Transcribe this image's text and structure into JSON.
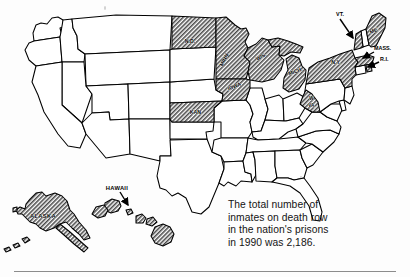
{
  "figure": {
    "caption": {
      "lines": [
        "The total number of",
        "inmates on death row",
        "in the nation's prisons",
        "in 1990 was 2,186."
      ],
      "full_text": "The total number of inmates on death row in the nation's prisons in 1990 was 2,186.",
      "year": "1990",
      "total_inmates": "2,186"
    },
    "colors": {
      "outline": "#000000",
      "unshaded_fill": "#ffffff",
      "shaded_fill": "#9a9a9a",
      "background": "#fdfdfd",
      "rule": "#8c8c8c",
      "caption_text": "#141414"
    },
    "state_labels": [
      {
        "id": "north-dakota",
        "label": "N.D.",
        "shaded": true,
        "x": 190,
        "y": 43
      },
      {
        "id": "minnesota",
        "label": "MINN.",
        "shaded": true,
        "x": 226,
        "y": 60,
        "rotate": -62
      },
      {
        "id": "wisconsin",
        "label": "WIS.",
        "shaded": true,
        "x": 262,
        "y": 58,
        "rotate": -30
      },
      {
        "id": "michigan",
        "label": "MICH.",
        "shaded": true,
        "x": 296,
        "y": 72,
        "rotate": -18
      },
      {
        "id": "iowa",
        "label": "IOWA",
        "shaded": true,
        "x": 237,
        "y": 85,
        "rotate": -22
      },
      {
        "id": "kansas",
        "label": "KAN.",
        "shaded": true,
        "x": 199,
        "y": 122
      },
      {
        "id": "new-york",
        "label": "N.Y.",
        "shaded": true,
        "x": 342,
        "y": 61
      },
      {
        "id": "west-virginia",
        "label": "W.",
        "shaded": true,
        "x": 313,
        "y": 99
      },
      {
        "id": "west-virginia-2",
        "label": "VA.",
        "shaded": true,
        "x": 313,
        "y": 106
      },
      {
        "id": "maine",
        "label": "ME.",
        "shaded": true,
        "x": 371,
        "y": 33,
        "rotate": -25
      },
      {
        "id": "alaska",
        "label": "ALASKA",
        "shaded": true,
        "x": 41,
        "y": 219
      }
    ],
    "callouts": [
      {
        "id": "vermont",
        "label": "VT.",
        "shaded": true,
        "text_x": 340,
        "text_y": 18,
        "to_x": 355,
        "to_y": 38
      },
      {
        "id": "massachusetts",
        "label": "MASS.",
        "shaded": true,
        "text_x": 374,
        "text_y": 48,
        "to_x": 362,
        "to_y": 55
      },
      {
        "id": "rhode-island",
        "label": "R.I.",
        "shaded": true,
        "text_x": 383,
        "text_y": 59,
        "to_x": 366,
        "to_y": 62
      },
      {
        "id": "hawaii",
        "label": "HAWAII",
        "shaded": true,
        "text_x": 102,
        "text_y": 191,
        "to_x": 130,
        "to_y": 208
      }
    ],
    "shaded_states": [
      "North Dakota",
      "Minnesota",
      "Wisconsin",
      "Michigan",
      "Iowa",
      "Kansas",
      "New York",
      "Vermont",
      "Maine",
      "Massachusetts",
      "Rhode Island",
      "West Virginia",
      "Alaska",
      "Hawaii"
    ],
    "insets": [
      {
        "id": "alaska-inset",
        "label": "ALASKA"
      },
      {
        "id": "hawaii-inset",
        "label": "HAWAII"
      }
    ]
  }
}
